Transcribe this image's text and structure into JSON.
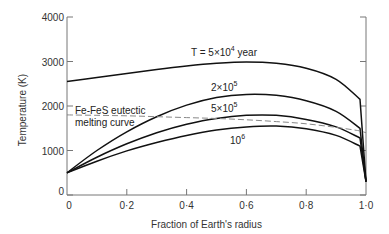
{
  "chart_data": {
    "type": "line",
    "title": "",
    "xlabel": "Fraction of Earth's radius",
    "ylabel": "Temperature (K)",
    "xlim": [
      0,
      1.0
    ],
    "ylim": [
      0,
      4000
    ],
    "x_ticks": [
      "0",
      "0·2",
      "0·4",
      "0·6",
      "0·8",
      "1·0"
    ],
    "y_ticks": [
      "0",
      "1000",
      "2000",
      "3000",
      "4000"
    ],
    "grid": false,
    "legend": "inline labels",
    "x": [
      0,
      0.1,
      0.2,
      0.3,
      0.4,
      0.5,
      0.6,
      0.7,
      0.8,
      0.9,
      0.98,
      1.0
    ],
    "series": [
      {
        "name": "T = 5×10^4 year",
        "label_main": "T = 5×10",
        "label_exp": "4",
        "label_suffix": " year",
        "values": [
          2550,
          2640,
          2730,
          2820,
          2900,
          2960,
          2990,
          2960,
          2850,
          2600,
          2150,
          300
        ],
        "style": "solid"
      },
      {
        "name": "2×10^5",
        "label_main": "2×10",
        "label_exp": "5",
        "values": [
          500,
          1000,
          1420,
          1760,
          2020,
          2190,
          2260,
          2240,
          2120,
          1880,
          1500,
          300
        ],
        "style": "solid"
      },
      {
        "name": "5×10^5",
        "label_main": "5×10",
        "label_exp": "5",
        "values": [
          500,
          850,
          1150,
          1400,
          1590,
          1720,
          1790,
          1790,
          1700,
          1530,
          1280,
          300
        ],
        "style": "solid"
      },
      {
        "name": "10^6",
        "label_main": "10",
        "label_exp": "6",
        "values": [
          500,
          760,
          990,
          1180,
          1340,
          1460,
          1530,
          1550,
          1490,
          1340,
          1100,
          300
        ],
        "style": "solid"
      },
      {
        "name": "Fe-FeS eutectic melting curve",
        "label_line1": "Fe-FeS eutectic",
        "label_line2": "melting curve",
        "values": [
          1800,
          1790,
          1780,
          1760,
          1740,
          1720,
          1690,
          1650,
          1600,
          1520,
          1440,
          1400
        ],
        "style": "dashed"
      }
    ]
  }
}
